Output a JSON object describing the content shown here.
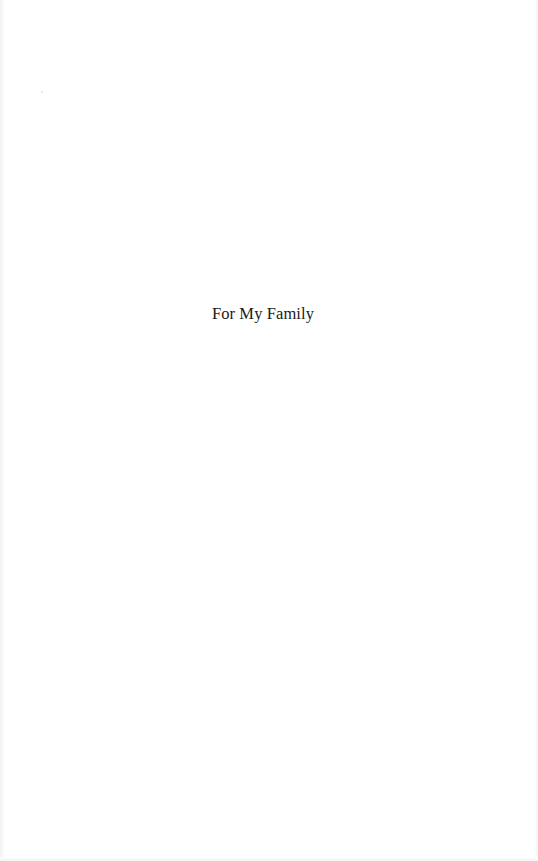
{
  "page": {
    "type": "dedication-page",
    "background": "#ffffff",
    "text_color": "#1a1a1a"
  },
  "dedication": {
    "text": "For My Family"
  }
}
